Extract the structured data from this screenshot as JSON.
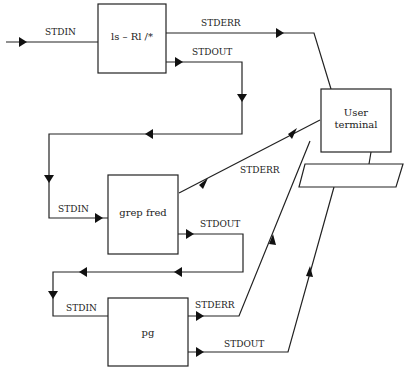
{
  "diagram": {
    "title": "",
    "processes": [
      {
        "id": "ls",
        "label": "ls – Rl /*"
      },
      {
        "id": "grep",
        "label": "grep fred"
      },
      {
        "id": "pg",
        "label": "pg"
      }
    ],
    "terminal": {
      "line1": "User",
      "line2": "terminal"
    },
    "streams": {
      "ls_stdin": "STDIN",
      "ls_stderr": "STDERR",
      "ls_stdout": "STDOUT",
      "grep_stdin": "STDIN",
      "grep_stderr": "STDERR",
      "grep_stdout": "STDOUT",
      "pg_stdin": "STDIN",
      "pg_stderr": "STDERR",
      "pg_stdout": "STDOUT"
    },
    "edges": [
      {
        "from": "input",
        "to": "ls",
        "label": "STDIN"
      },
      {
        "from": "ls",
        "to": "terminal",
        "label": "STDERR"
      },
      {
        "from": "ls",
        "to": "grep",
        "label": "STDOUT"
      },
      {
        "from": "grep",
        "to": "terminal",
        "label": "STDERR"
      },
      {
        "from": "grep",
        "to": "pg",
        "label": "STDOUT"
      },
      {
        "from": "pg",
        "to": "terminal",
        "label": "STDERR"
      },
      {
        "from": "pg",
        "to": "terminal",
        "label": "STDOUT"
      }
    ]
  }
}
